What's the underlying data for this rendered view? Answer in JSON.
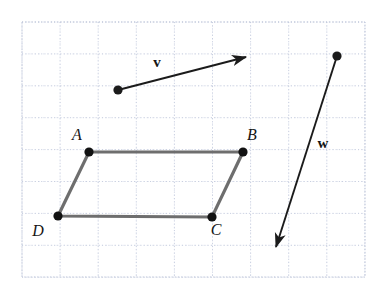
{
  "figure": {
    "background_color": "#ffffff"
  },
  "grid": {
    "x_left": 22,
    "x_right": 365,
    "y_top": 22,
    "y_bottom": 277,
    "major_spacing_x": 38.1,
    "major_spacing_y": 31.9,
    "minor_tick_spacing": 4.2,
    "major_line_color": "#c9cfe0",
    "minor_dot_color": "#dfe3ee",
    "border_color": "#bcc4d8",
    "columns": 9,
    "rows": 8
  },
  "vectors": [
    {
      "name": "v",
      "label": "v",
      "label_x": 157,
      "label_y": 67,
      "tail_x": 118,
      "tail_y": 90,
      "head_x": 246,
      "head_y": 57,
      "has_tail_dot": true,
      "color": "#1b1b1b",
      "stroke_width": 1.9
    },
    {
      "name": "w",
      "label": "w",
      "label_x": 323,
      "label_y": 148,
      "tail_x": 337,
      "tail_y": 56,
      "head_x": 276,
      "head_y": 247,
      "has_tail_dot": true,
      "color": "#1b1b1b",
      "stroke_width": 1.9
    }
  ],
  "parallelogram": {
    "name": "ABCD",
    "edge_color": "#6e6e6e",
    "edge_width": 3.2,
    "vertex_color": "#121212",
    "vertex_radius": 4.6,
    "vertices": [
      {
        "label": "A",
        "x": 89,
        "y": 152,
        "label_x": 77,
        "label_y": 140
      },
      {
        "label": "B",
        "x": 243,
        "y": 152,
        "label_x": 252,
        "label_y": 140
      },
      {
        "label": "C",
        "x": 212,
        "y": 217,
        "label_x": 216,
        "label_y": 235
      },
      {
        "label": "D",
        "x": 58,
        "y": 216,
        "label_x": 38,
        "label_y": 236
      }
    ]
  },
  "chart_data": {
    "type": "scatter",
    "xlabel": "",
    "ylabel": "",
    "xlim": [
      22,
      365
    ],
    "ylim": [
      22,
      277
    ],
    "grid": true,
    "legend": "none",
    "series": [
      {
        "name": "vector-v",
        "kind": "arrow",
        "points": [
          [
            118,
            90
          ],
          [
            246,
            57
          ]
        ],
        "annotation": "v"
      },
      {
        "name": "vector-w",
        "kind": "arrow",
        "points": [
          [
            337,
            56
          ],
          [
            276,
            247
          ]
        ],
        "annotation": "w"
      },
      {
        "name": "parallelogram-ABCD",
        "kind": "polygon",
        "points": [
          [
            89,
            152
          ],
          [
            243,
            152
          ],
          [
            212,
            217
          ],
          [
            58,
            216
          ]
        ],
        "labels": [
          "A",
          "B",
          "C",
          "D"
        ]
      }
    ]
  }
}
